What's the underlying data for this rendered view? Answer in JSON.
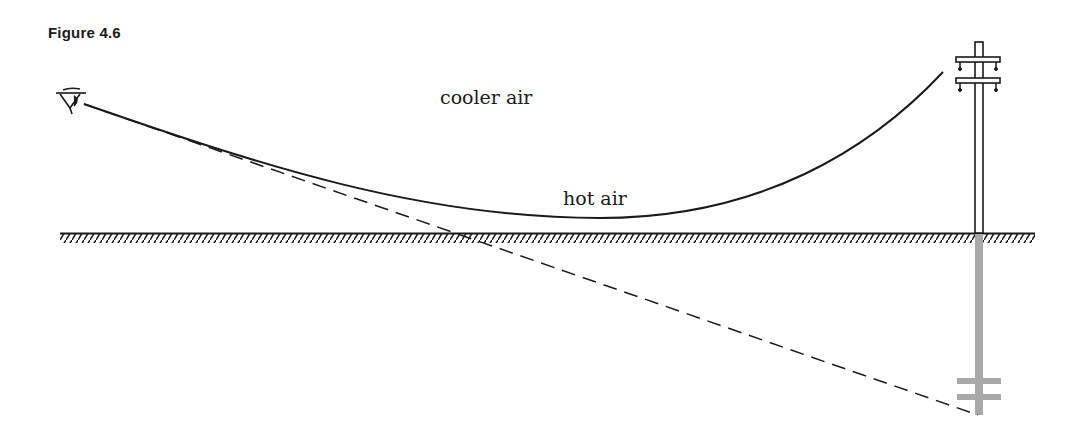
{
  "figure": {
    "title": "Figure 4.6",
    "labels": {
      "upper": "cooler air",
      "lower": "hot air"
    },
    "icons": {
      "observer": "eye-icon",
      "object": "telephone-pole-icon",
      "image": "inverted-pole-reflection-icon"
    },
    "colors": {
      "ink": "#1a1a1a",
      "reflection": "#a8a8a8",
      "background": "#ffffff"
    }
  }
}
